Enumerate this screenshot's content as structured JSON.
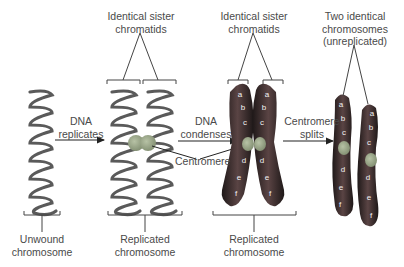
{
  "diagram": {
    "labels": {
      "top_sister_1": [
        "Identical sister",
        "chromatids"
      ],
      "top_sister_2": [
        "Identical sister",
        "chromatids"
      ],
      "top_two_identical": [
        "Two identical",
        "chromosomes",
        "(unreplicated)"
      ],
      "step_replicates": [
        "DNA",
        "replicates"
      ],
      "step_condenses": [
        "DNA",
        "condenses"
      ],
      "step_splits": [
        "Centromere",
        "splits"
      ],
      "centromere": "Centromere",
      "bottom_unwound": [
        "Unwound",
        "chromosome"
      ],
      "bottom_replicated_1": [
        "Replicated",
        "chromosome"
      ],
      "bottom_replicated_2": [
        "Replicated",
        "chromosome"
      ]
    },
    "segments": [
      "a",
      "b",
      "c",
      "d",
      "e",
      "f"
    ],
    "colors": {
      "dna_strand": "#5a5a5a",
      "centromere": "#9aa58a",
      "chromosome_dark": "#3a2e2e",
      "chromosome_band": "#8a6a66",
      "text": "#4a4a4a"
    }
  }
}
